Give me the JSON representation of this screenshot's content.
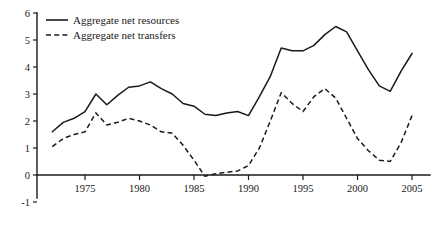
{
  "chart_data": {
    "type": "line",
    "title": "",
    "subtitle": "",
    "xlabel": "",
    "ylabel": "",
    "xlim": [
      1972,
      2005
    ],
    "ylim": [
      -1,
      6
    ],
    "grid": false,
    "legend_position": "top-left",
    "y_ticks": [
      -1,
      0,
      1,
      2,
      3,
      4,
      5,
      6
    ],
    "y_tick_labels": [
      "-1",
      "0",
      "1",
      "2",
      "3",
      "4",
      "5",
      "6"
    ],
    "x_ticks": [
      1975,
      1980,
      1985,
      1990,
      1995,
      2000,
      2005
    ],
    "x_tick_labels": [
      "1975",
      "1980",
      "1985",
      "1990",
      "1995",
      "2000",
      "2005"
    ],
    "x": [
      1972,
      1973,
      1974,
      1975,
      1976,
      1977,
      1978,
      1979,
      1980,
      1981,
      1982,
      1983,
      1984,
      1985,
      1986,
      1987,
      1988,
      1989,
      1990,
      1991,
      1992,
      1993,
      1994,
      1995,
      1996,
      1997,
      1998,
      1999,
      2000,
      2001,
      2002,
      2003,
      2004,
      2005
    ],
    "series": [
      {
        "name": "Aggregate net resources",
        "style": "solid",
        "color": "#1a1a1a",
        "values": [
          1.6,
          1.95,
          2.1,
          2.35,
          3.0,
          2.6,
          2.95,
          3.25,
          3.3,
          3.45,
          3.2,
          3.0,
          2.65,
          2.55,
          2.25,
          2.2,
          2.3,
          2.35,
          2.2,
          2.9,
          3.65,
          4.7,
          4.6,
          4.6,
          4.8,
          5.2,
          5.5,
          5.3,
          4.6,
          3.9,
          3.3,
          3.1,
          3.85,
          4.5
        ]
      },
      {
        "name": "Aggregate net transfers",
        "style": "dashed",
        "color": "#1a1a1a",
        "values": [
          1.05,
          1.35,
          1.5,
          1.6,
          2.3,
          1.85,
          1.95,
          2.1,
          2.0,
          1.85,
          1.6,
          1.55,
          1.1,
          0.55,
          -0.05,
          0.05,
          0.1,
          0.15,
          0.35,
          1.0,
          2.0,
          3.05,
          2.65,
          2.35,
          2.9,
          3.2,
          2.85,
          2.1,
          1.35,
          0.9,
          0.55,
          0.5,
          1.2,
          2.2
        ]
      }
    ],
    "legend": [
      {
        "label": "Aggregate net resources",
        "style": "solid"
      },
      {
        "label": "Aggregate net transfers",
        "style": "dashed"
      }
    ],
    "axis_color": "#1a1a1a"
  }
}
